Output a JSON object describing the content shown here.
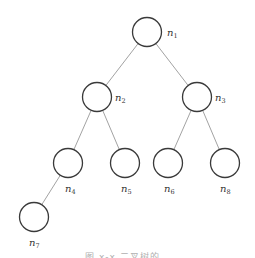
{
  "diagram": {
    "type": "binary-tree",
    "nodes": [
      {
        "id": "n1",
        "label": "n",
        "sub": "1",
        "cx": 147,
        "cy": 32,
        "lx": 167,
        "ly": 36
      },
      {
        "id": "n2",
        "label": "n",
        "sub": "2",
        "cx": 97,
        "cy": 97,
        "lx": 115,
        "ly": 101
      },
      {
        "id": "n3",
        "label": "n",
        "sub": "3",
        "cx": 197,
        "cy": 97,
        "lx": 215,
        "ly": 101
      },
      {
        "id": "n4",
        "label": "n",
        "sub": "4",
        "cx": 68,
        "cy": 163,
        "lx": 65,
        "ly": 192
      },
      {
        "id": "n5",
        "label": "n",
        "sub": "5",
        "cx": 125,
        "cy": 163,
        "lx": 121,
        "ly": 192
      },
      {
        "id": "n6",
        "label": "n",
        "sub": "6",
        "cx": 168,
        "cy": 163,
        "lx": 164,
        "ly": 192
      },
      {
        "id": "n8",
        "label": "n",
        "sub": "8",
        "cx": 225,
        "cy": 163,
        "lx": 220,
        "ly": 192
      },
      {
        "id": "n7",
        "label": "n",
        "sub": "7",
        "cx": 34,
        "cy": 217,
        "lx": 29,
        "ly": 246
      }
    ],
    "edges": [
      [
        "n1",
        "n2"
      ],
      [
        "n1",
        "n3"
      ],
      [
        "n2",
        "n4"
      ],
      [
        "n2",
        "n5"
      ],
      [
        "n3",
        "n6"
      ],
      [
        "n3",
        "n8"
      ],
      [
        "n4",
        "n7"
      ]
    ],
    "radius": 14.5
  },
  "caption": "图 x-x 二叉树的…"
}
